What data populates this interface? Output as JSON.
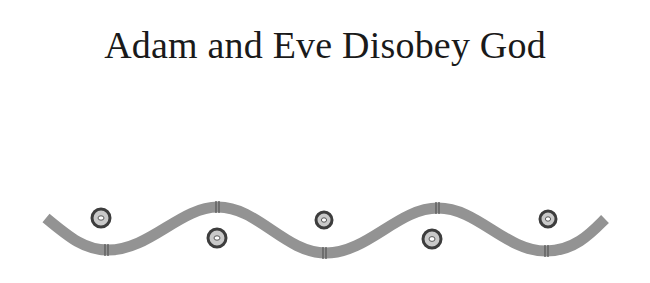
{
  "page": {
    "title": "Adam and Eve Disobey God"
  },
  "ornament": {
    "type": "wavy-border",
    "wave_color": "#8f8f8f",
    "band_color": "#5a5a5a",
    "dot_ring_color": "#3d3d3d",
    "dot_fill_color": "#b5b5b5",
    "dot_center_color": "#ffffff",
    "dot_count": 5
  }
}
